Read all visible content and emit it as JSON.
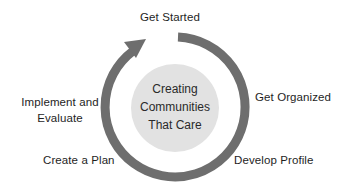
{
  "diagram": {
    "center_title": [
      "Creating",
      "Communities",
      "That Care"
    ],
    "steps": [
      {
        "label": "Get Started"
      },
      {
        "label": "Get Organized"
      },
      {
        "label": "Develop Profile"
      },
      {
        "label": "Create a Plan"
      },
      {
        "label": "Implement and",
        "label2": "Evaluate"
      }
    ],
    "colors": {
      "ring": "#6e6e6e",
      "center_fill": "#e2e2e2",
      "text": "#1e1e1e"
    }
  }
}
